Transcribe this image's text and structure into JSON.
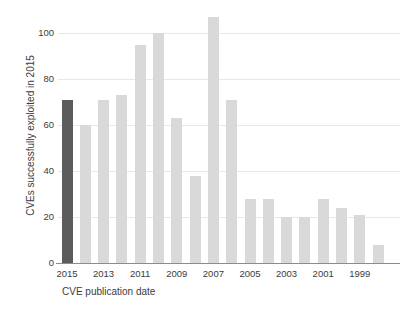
{
  "chart_data": {
    "type": "bar",
    "title": "",
    "subtitle": "",
    "xlabel": "CVE publication date",
    "ylabel": "CVEs successfully exploited in 2015",
    "categories": [
      "2015",
      "2014",
      "2013",
      "2012",
      "2011",
      "2010",
      "2009",
      "2008",
      "2007",
      "2006",
      "2005",
      "2004",
      "2003",
      "2002",
      "2001",
      "2000",
      "1999",
      "1998"
    ],
    "values": [
      71,
      60,
      71,
      73,
      95,
      100,
      63,
      38,
      107,
      71,
      28,
      28,
      20,
      20,
      28,
      24,
      21,
      8
    ],
    "xtick_labels": [
      "2015",
      "2013",
      "2011",
      "2009",
      "2007",
      "2005",
      "2003",
      "2001",
      "1999"
    ],
    "xtick_categories": [
      "2015",
      "2013",
      "2011",
      "2009",
      "2007",
      "2005",
      "2003",
      "2001",
      "1999"
    ],
    "ytick_labels": [
      "100",
      "80",
      "60",
      "40",
      "20",
      "0"
    ],
    "ytick_values": [
      100,
      80,
      60,
      40,
      20,
      0
    ],
    "ylim": [
      0,
      112
    ],
    "grid": true,
    "legend": "none",
    "highlight_category": "2015",
    "colors": {
      "bar_default": "#d9d9d9",
      "bar_highlight": "#5c5c5c",
      "gridline": "#e8e8e8",
      "axis": "#8c8c8c",
      "text": "#3c3c3c",
      "background": "#ffffff"
    }
  }
}
